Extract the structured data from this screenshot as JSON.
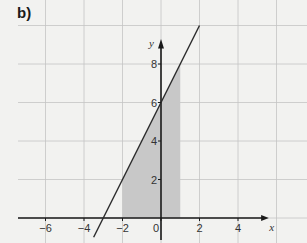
{
  "panel_label": "b)",
  "chart_data": {
    "type": "line",
    "title": "",
    "xlabel": "x",
    "ylabel": "y",
    "xlim": [
      -7.5,
      5.5
    ],
    "ylim": [
      -1,
      10
    ],
    "x_ticks": [
      -6,
      -4,
      -2,
      0,
      2,
      4
    ],
    "y_ticks": [
      2,
      4,
      6,
      8
    ],
    "x_tick_labels": [
      "−6",
      "−4",
      "−2",
      "0",
      "2",
      "4"
    ],
    "y_tick_labels": [
      "2",
      "4",
      "6",
      "8"
    ],
    "grid": true,
    "series": [
      {
        "name": "y = 2x + 6",
        "x": [
          -3.5,
          2
        ],
        "y": [
          -1,
          10
        ],
        "color": "#2a2a2a"
      }
    ],
    "shaded_region": {
      "x_from": -2,
      "x_to": 1,
      "under": "y = 2x + 6",
      "above": 0,
      "color": "#c8c8c8"
    },
    "annotations": []
  },
  "colors": {
    "background": "#f2f2f0",
    "grid": "#c4c4c4",
    "axis": "#1a1a1a",
    "shade": "#c8c8c8",
    "line": "#2a2a2a"
  }
}
